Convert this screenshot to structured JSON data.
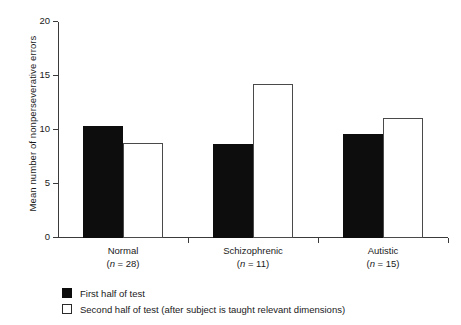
{
  "chart_data": {
    "type": "bar",
    "title": "",
    "xlabel": "",
    "ylabel": "Mean number of nonperseverative errors",
    "ylim": [
      0,
      20
    ],
    "yticks": [
      0,
      5,
      10,
      15,
      20
    ],
    "ytick_labels": [
      "0",
      "5",
      "10",
      "15",
      "20"
    ],
    "grid": false,
    "legend_position": "below-left",
    "categories": [
      "Normal",
      "Schizophrenic",
      "Autistic"
    ],
    "category_sublabels": [
      "(n = 28)",
      "(n = 11)",
      "(n = 15)"
    ],
    "category_n": [
      28,
      11,
      15
    ],
    "series": [
      {
        "name": "First half of test",
        "style": "filled",
        "color": "#0d0d0d",
        "values": [
          10.4,
          8.7,
          9.6
        ]
      },
      {
        "name": "Second half of test (after subject is taught relevant dimensions)",
        "style": "open",
        "color": "#ffffff",
        "values": [
          8.8,
          14.3,
          11.1
        ]
      }
    ]
  },
  "legend": {
    "items": [
      {
        "label": "First half of test",
        "style": "filled"
      },
      {
        "label": "Second half of test (after subject is taught relevant dimensions)",
        "style": "open"
      }
    ]
  }
}
